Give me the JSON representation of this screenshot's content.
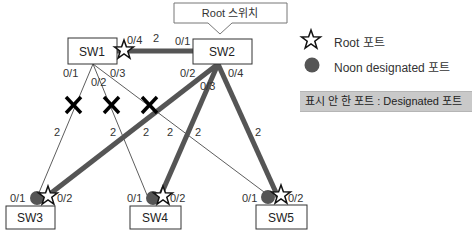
{
  "diagram": {
    "title_callout": "Root 스위치",
    "root_switch": "SW2",
    "switches": [
      {
        "id": "SW1",
        "label": "SW1"
      },
      {
        "id": "SW2",
        "label": "SW2"
      },
      {
        "id": "SW3",
        "label": "SW3"
      },
      {
        "id": "SW4",
        "label": "SW4"
      },
      {
        "id": "SW5",
        "label": "SW5"
      }
    ],
    "ports": {
      "sw1": {
        "p01": "0/1",
        "p02": "0/2",
        "p03": "0/3",
        "p04": "0/4"
      },
      "sw2": {
        "p01": "0/1",
        "p02": "0/2",
        "p03": "0/3",
        "p04": "0/4"
      },
      "sw3": {
        "p01": "0/1",
        "p02": "0/2"
      },
      "sw4": {
        "p01": "0/1",
        "p02": "0/2"
      },
      "sw5": {
        "p01": "0/1",
        "p02": "0/2"
      }
    },
    "link_costs": {
      "sw1_sw2": "2",
      "sw1_sw3": "2",
      "sw1_sw4": "2",
      "sw1_sw5": "2",
      "sw2_sw3": "2",
      "sw2_sw4": "2",
      "sw2_sw5": "2"
    },
    "links": [
      {
        "from": "SW1 0/4",
        "to": "SW2 0/1",
        "cost": 2,
        "state": "forwarding"
      },
      {
        "from": "SW1 0/1",
        "to": "SW3 0/1",
        "cost": 2,
        "state": "blocked"
      },
      {
        "from": "SW1 0/2",
        "to": "SW4 0/1",
        "cost": 2,
        "state": "blocked"
      },
      {
        "from": "SW1 0/3",
        "to": "SW5 0/1",
        "cost": 2,
        "state": "blocked"
      },
      {
        "from": "SW2 0/2",
        "to": "SW3 0/2",
        "cost": 2,
        "state": "forwarding"
      },
      {
        "from": "SW2 0/3",
        "to": "SW4 0/2",
        "cost": 2,
        "state": "forwarding"
      },
      {
        "from": "SW2 0/4",
        "to": "SW5 0/2",
        "cost": 2,
        "state": "forwarding"
      }
    ],
    "colors": {
      "active_link": "#555555",
      "blocked_link": "#333333",
      "block_mark": "#000000",
      "non_designated": "#555555",
      "note_bg": "#c9c9c9"
    }
  },
  "legend": {
    "root_port": "Root 포트",
    "non_designated_port": "Noon designated 포트",
    "note": "표시 안 한 포트 : Designated 포트"
  }
}
